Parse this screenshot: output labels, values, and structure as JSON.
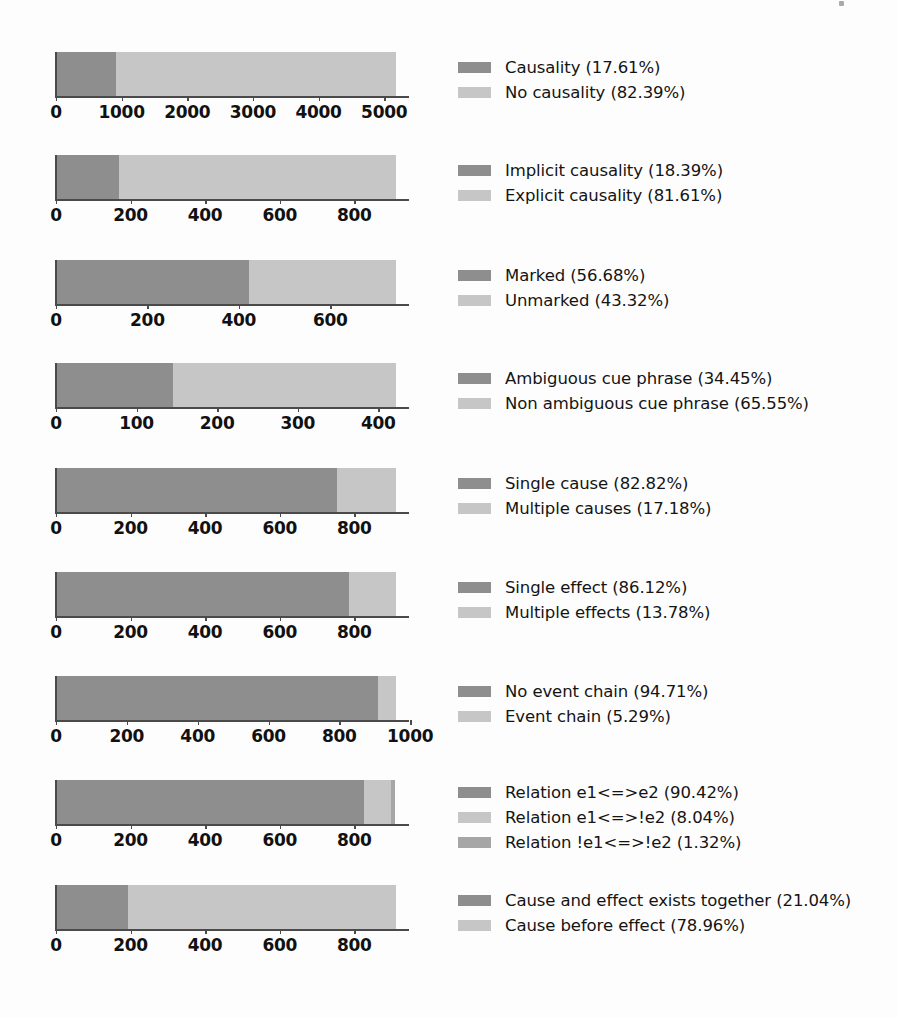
{
  "chart_data": [
    {
      "type": "bar",
      "orientation": "horizontal",
      "stacked": true,
      "title": "",
      "xlabel": "",
      "ylabel": "",
      "grid": false,
      "legend_position": "right",
      "xlim": [
        0,
        5180
      ],
      "ticks": [
        0,
        1000,
        2000,
        3000,
        4000,
        5000
      ],
      "tick_labels": [
        "0",
        "1000",
        "2000",
        "3000",
        "4000",
        "5000"
      ],
      "series": [
        {
          "name": "Causality",
          "percent": 17.61,
          "label": "Causality (17.61%)",
          "color": "#8e8e8e",
          "value": 912
        },
        {
          "name": "No causality",
          "percent": 82.39,
          "label": "No causality (82.39%)",
          "color": "#c6c6c6",
          "value": 4268
        }
      ]
    },
    {
      "type": "bar",
      "orientation": "horizontal",
      "stacked": true,
      "title": "",
      "xlabel": "",
      "ylabel": "",
      "grid": false,
      "legend_position": "right",
      "xlim": [
        0,
        912
      ],
      "ticks": [
        0,
        200,
        400,
        600,
        800
      ],
      "tick_labels": [
        "0",
        "200",
        "400",
        "600",
        "800"
      ],
      "series": [
        {
          "name": "Implicit causality",
          "percent": 18.39,
          "label": "Implicit causality (18.39%)",
          "color": "#8e8e8e",
          "value": 168
        },
        {
          "name": "Explicit causality",
          "percent": 81.61,
          "label": "Explicit causality (81.61%)",
          "color": "#c6c6c6",
          "value": 744
        }
      ]
    },
    {
      "type": "bar",
      "orientation": "horizontal",
      "stacked": true,
      "title": "",
      "xlabel": "",
      "ylabel": "",
      "grid": false,
      "legend_position": "right",
      "xlim": [
        0,
        744
      ],
      "ticks": [
        0,
        200,
        400,
        600
      ],
      "tick_labels": [
        "0",
        "200",
        "400",
        "600"
      ],
      "series": [
        {
          "name": "Marked",
          "percent": 56.68,
          "label": "Marked (56.68%)",
          "color": "#8e8e8e",
          "value": 422
        },
        {
          "name": "Unmarked",
          "percent": 43.32,
          "label": "Unmarked (43.32%)",
          "color": "#c6c6c6",
          "value": 322
        }
      ]
    },
    {
      "type": "bar",
      "orientation": "horizontal",
      "stacked": true,
      "title": "",
      "xlabel": "",
      "ylabel": "",
      "grid": false,
      "legend_position": "right",
      "xlim": [
        0,
        422
      ],
      "ticks": [
        0,
        100,
        200,
        300,
        400
      ],
      "tick_labels": [
        "0",
        "100",
        "200",
        "300",
        "400"
      ],
      "series": [
        {
          "name": "Ambiguous cue phrase",
          "percent": 34.45,
          "label": "Ambiguous cue phrase (34.45%)",
          "color": "#8e8e8e",
          "value": 145
        },
        {
          "name": "Non ambiguous cue phrase",
          "percent": 65.55,
          "label": "Non ambiguous cue phrase (65.55%)",
          "color": "#c6c6c6",
          "value": 277
        }
      ]
    },
    {
      "type": "bar",
      "orientation": "horizontal",
      "stacked": true,
      "title": "",
      "xlabel": "",
      "ylabel": "",
      "grid": false,
      "legend_position": "right",
      "xlim": [
        0,
        912
      ],
      "ticks": [
        0,
        200,
        400,
        600,
        800
      ],
      "tick_labels": [
        "0",
        "200",
        "400",
        "600",
        "800"
      ],
      "series": [
        {
          "name": "Single cause",
          "percent": 82.82,
          "label": "Single cause (82.82%)",
          "color": "#8e8e8e",
          "value": 755
        },
        {
          "name": "Multiple causes",
          "percent": 17.18,
          "label": "Multiple causes (17.18%)",
          "color": "#c6c6c6",
          "value": 157
        }
      ]
    },
    {
      "type": "bar",
      "orientation": "horizontal",
      "stacked": true,
      "title": "",
      "xlabel": "",
      "ylabel": "",
      "grid": false,
      "legend_position": "right",
      "xlim": [
        0,
        912
      ],
      "ticks": [
        0,
        200,
        400,
        600,
        800
      ],
      "tick_labels": [
        "0",
        "200",
        "400",
        "600",
        "800"
      ],
      "series": [
        {
          "name": "Single effect",
          "percent": 86.12,
          "label": "Single effect (86.12%)",
          "color": "#8e8e8e",
          "value": 785
        },
        {
          "name": "Multiple effects",
          "percent": 13.78,
          "label": "Multiple effects (13.78%)",
          "color": "#c6c6c6",
          "value": 127
        }
      ]
    },
    {
      "type": "bar",
      "orientation": "horizontal",
      "stacked": true,
      "title": "",
      "xlabel": "",
      "ylabel": "",
      "grid": false,
      "legend_position": "right",
      "xlim": [
        0,
        960
      ],
      "ticks": [
        0,
        200,
        400,
        600,
        800,
        1000
      ],
      "tick_labels": [
        "0",
        "200",
        "400",
        "600",
        "800",
        "1000"
      ],
      "series": [
        {
          "name": "No event chain",
          "percent": 94.71,
          "label": "No event chain (94.71%)",
          "color": "#8e8e8e",
          "value": 909
        },
        {
          "name": "Event chain",
          "percent": 5.29,
          "label": "Event chain (5.29%)",
          "color": "#c6c6c6",
          "value": 51
        }
      ]
    },
    {
      "type": "bar",
      "orientation": "horizontal",
      "stacked": true,
      "title": "",
      "xlabel": "",
      "ylabel": "",
      "grid": false,
      "legend_position": "right",
      "xlim": [
        0,
        912
      ],
      "ticks": [
        0,
        200,
        400,
        600,
        800
      ],
      "tick_labels": [
        "0",
        "200",
        "400",
        "600",
        "800"
      ],
      "series": [
        {
          "name": "Relation e1<=>e2",
          "percent": 90.42,
          "label": "Relation e1<=>e2 (90.42%)",
          "color": "#8e8e8e",
          "value": 825
        },
        {
          "name": "Relation e1<=>!e2",
          "percent": 8.04,
          "label": "Relation e1<=>!e2 (8.04%)",
          "color": "#c6c6c6",
          "value": 73
        },
        {
          "name": "Relation !e1<=>!e2",
          "percent": 1.32,
          "label": "Relation !e1<=>!e2 (1.32%)",
          "color": "#a6a6a6",
          "value": 12
        }
      ]
    },
    {
      "type": "bar",
      "orientation": "horizontal",
      "stacked": true,
      "title": "",
      "xlabel": "",
      "ylabel": "",
      "grid": false,
      "legend_position": "right",
      "xlim": [
        0,
        912
      ],
      "ticks": [
        0,
        200,
        400,
        600,
        800
      ],
      "tick_labels": [
        "0",
        "200",
        "400",
        "600",
        "800"
      ],
      "series": [
        {
          "name": "Cause and effect exists together",
          "percent": 21.04,
          "label": "Cause and effect exists together (21.04%)",
          "color": "#8e8e8e",
          "value": 192
        },
        {
          "name": "Cause before effect",
          "percent": 78.96,
          "label": "Cause before effect (78.96%)",
          "color": "#c6c6c6",
          "value": 720
        }
      ]
    }
  ],
  "layout": {
    "panel_tops": [
      52,
      155,
      260,
      363,
      468,
      572,
      676,
      780,
      885
    ],
    "plot_left": 56,
    "plot_width": 340,
    "legend_left": 458,
    "bar_height": 44
  },
  "colors": {
    "dark": "#8e8e8e",
    "light": "#c6c6c6",
    "mid": "#a6a6a6",
    "axis": "#4a4a4a",
    "text": "#141414",
    "background": "#fdfdfd"
  }
}
